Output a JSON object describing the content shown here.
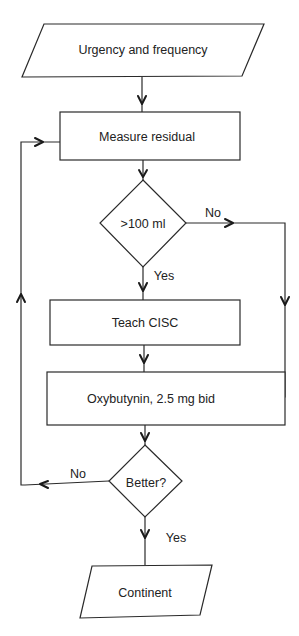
{
  "diagram": {
    "type": "flowchart",
    "nodes": {
      "start": {
        "label": "Urgency and frequency",
        "shape": "parallelogram"
      },
      "measure": {
        "label": "Measure residual",
        "shape": "rectangle"
      },
      "decision1": {
        "label": ">100 ml",
        "shape": "diamond"
      },
      "teach": {
        "label": "Teach CISC",
        "shape": "rectangle"
      },
      "oxy": {
        "label": "Oxybutynin, 2.5 mg bid",
        "shape": "rectangle"
      },
      "decision2": {
        "label": "Better?",
        "shape": "diamond"
      },
      "end": {
        "label": "Continent",
        "shape": "parallelogram"
      }
    },
    "edges": {
      "d1_no": {
        "from": "decision1",
        "to": "oxy",
        "label": "No"
      },
      "d1_yes": {
        "from": "decision1",
        "to": "teach",
        "label": "Yes"
      },
      "d2_no": {
        "from": "decision2",
        "to": "measure",
        "label": "No"
      },
      "d2_yes": {
        "from": "decision2",
        "to": "end",
        "label": "Yes"
      }
    }
  }
}
